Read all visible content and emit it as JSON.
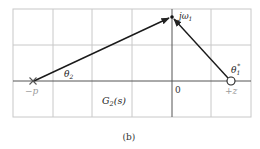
{
  "diagram": {
    "caption": "(b)",
    "grid": {
      "left": 13,
      "top": 9,
      "right": 251,
      "bottom": 117,
      "vertical_lines": [
        53,
        92,
        132,
        211
      ],
      "horizontal_lines": [
        45
      ],
      "color": "#c8c8c8"
    },
    "axes": {
      "real_axis_y": 81,
      "imag_axis_x": 172,
      "origin_label": "0",
      "color": "#444444"
    },
    "pole": {
      "label": "−p",
      "x": 33,
      "y": 81,
      "marker": "x-icon"
    },
    "zero": {
      "label": "+z",
      "x": 231,
      "y": 81,
      "marker": "circle-icon"
    },
    "test_point": {
      "label": "jω₁",
      "x": 172,
      "y": 17
    },
    "vectors": [
      {
        "from": "pole",
        "to": "test_point",
        "angle_label": "θ₂"
      },
      {
        "from": "zero",
        "to": "test_point",
        "angle_label": "θ₁*"
      }
    ],
    "angle_labels": {
      "theta2": "θ",
      "theta2_sub": "2",
      "theta1": "θ",
      "theta1_sub": "1",
      "theta1_sup": "*"
    },
    "function_label": {
      "main": "G",
      "sub": "2",
      "arg": "(s)"
    },
    "jw_label": {
      "main": "jω",
      "sub": "1"
    }
  }
}
